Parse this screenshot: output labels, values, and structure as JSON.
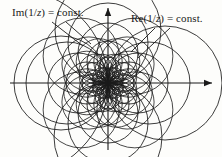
{
  "figure": {
    "background_color": "#fdfdfb",
    "stroke_color": "#1a1a1a",
    "text_color": "#1a1a1a"
  },
  "labels": {
    "im": {
      "full_text": "Im(1/z) = const.",
      "prefix": "Im(1/",
      "variable": "z",
      "suffix": ") = const."
    },
    "re": {
      "full_text": "Re(1/z) = const.",
      "prefix": "Re(1/",
      "variable": "z",
      "suffix": ") = const."
    }
  },
  "axes": {
    "origin": {
      "x": 108,
      "y": 83
    },
    "horizontal": {
      "x1": 10,
      "y1": 83,
      "x2": 212,
      "y2": 83,
      "arrow": "right"
    },
    "vertical": {
      "x1": 108,
      "y1": 150,
      "x2": 108,
      "y2": 8,
      "arrow": "up"
    }
  },
  "chart_data": {
    "type": "line",
    "xlabel": "",
    "ylabel": "",
    "families": [
      {
        "name": "Re(1/z) = const. (right lobe)",
        "angle_deg": 0,
        "radii": [
          7,
          13,
          21,
          30,
          41,
          57
        ]
      },
      {
        "name": "Re(1/z) = const. (left lobe)",
        "angle_deg": 180,
        "radii": [
          7,
          13,
          21,
          30,
          41,
          47,
          93
        ]
      },
      {
        "name": "Im(1/z) = const. (upper lobe)",
        "angle_deg": 90,
        "radii": [
          7,
          13,
          21,
          30,
          40,
          53
        ]
      },
      {
        "name": "Im(1/z) = const. (lower lobe)",
        "angle_deg": 270,
        "radii": [
          7,
          13,
          21,
          30,
          40,
          54
        ]
      },
      {
        "name": "intermediate rosette petals",
        "angles_deg": [
          45,
          135,
          225,
          315
        ],
        "radii": [
          9,
          17,
          27,
          38
        ]
      },
      {
        "name": "intermediate rosette petals (fine)",
        "angles_deg": [
          22.5,
          67.5,
          112.5,
          157.5,
          202.5,
          247.5,
          292.5,
          337.5
        ],
        "radii": [
          8,
          15,
          23
        ]
      }
    ],
    "legend_position": "none",
    "grid": false
  },
  "leaders": {
    "im": [
      {
        "x1": 52,
        "y1": 22,
        "x2": 83,
        "y2": 46
      },
      {
        "x1": 66,
        "y1": 22,
        "x2": 91,
        "y2": 44
      }
    ],
    "re": [
      {
        "x1": 170,
        "y1": 28,
        "x2": 138,
        "y2": 58
      },
      {
        "x1": 155,
        "y1": 28,
        "x2": 131,
        "y2": 52
      }
    ]
  }
}
